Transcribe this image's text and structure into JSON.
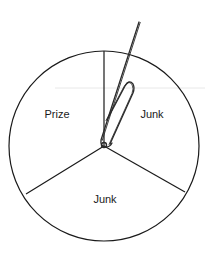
{
  "spinner": {
    "sections": [
      {
        "label": "Prize",
        "position": "upper-left"
      },
      {
        "label": "Junk",
        "position": "upper-right"
      },
      {
        "label": "Junk",
        "position": "bottom"
      }
    ],
    "pointer": "paperclip",
    "colors": {
      "stroke": "#1a1a1a",
      "background": "#ffffff",
      "artifact_line": "#e6e6e6"
    }
  }
}
